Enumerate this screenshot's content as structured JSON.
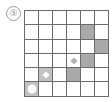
{
  "label": "⑤",
  "grid": {
    "rows": 6,
    "cols": 6,
    "cells": [
      [
        "empty",
        "empty",
        "empty",
        "empty",
        "empty",
        "empty"
      ],
      [
        "empty",
        "empty",
        "empty",
        "empty",
        "shaded",
        "empty"
      ],
      [
        "empty",
        "empty",
        "empty",
        "empty",
        "empty",
        "shaded"
      ],
      [
        "empty",
        "empty",
        "empty",
        "diamond-grey",
        "shaded",
        "empty"
      ],
      [
        "empty",
        "diamond-white",
        "empty",
        "shaded",
        "empty",
        "empty"
      ],
      [
        "circle-white",
        "empty",
        "empty",
        "empty",
        "empty",
        "empty"
      ]
    ]
  },
  "colors": {
    "line": "#6b6b6b",
    "shaded": "#a9a9a9",
    "marker_bg": "#c2c2c2"
  }
}
